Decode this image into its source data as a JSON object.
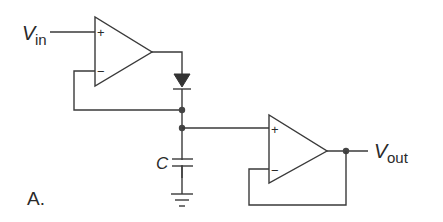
{
  "diagram": {
    "type": "circuit-schematic",
    "title_label": "A.",
    "input_label": {
      "main": "V",
      "sub": "in"
    },
    "output_label": {
      "main": "V",
      "sub": "out"
    },
    "capacitor_label": "C",
    "opamp1": {
      "plus": "+",
      "minus": "−",
      "role": "input buffer driving diode"
    },
    "opamp2": {
      "plus": "+",
      "minus": "−",
      "role": "voltage follower output buffer"
    },
    "components": [
      "op-amp",
      "diode",
      "capacitor",
      "ground",
      "op-amp"
    ],
    "colors": {
      "line": "#3a3a3a",
      "background": "#ffffff"
    }
  }
}
